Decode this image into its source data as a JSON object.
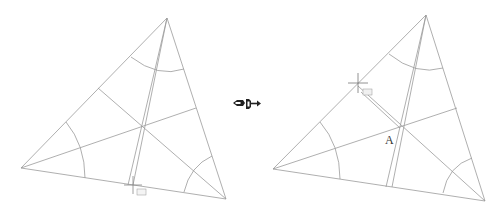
{
  "figure": {
    "caption_faint": "",
    "line_color": "#9a9a9a",
    "arc_color": "#8a8a8a",
    "panels": [
      {
        "id": "before",
        "vertices": {
          "top": [
            167,
            18
          ],
          "left": [
            21,
            168
          ],
          "right": [
            226,
            199
          ]
        },
        "center": [
          142,
          128
        ],
        "cursor": [
          133,
          185
        ],
        "cursor_tag": "≡≡"
      },
      {
        "id": "after",
        "vertices": {
          "top": [
            426,
            15
          ],
          "left": [
            273,
            169
          ],
          "right": [
            485,
            201
          ]
        },
        "center": [
          400,
          128
        ],
        "cursor": [
          358,
          83
        ],
        "cursor_tag": "≡≡",
        "point_label": "A"
      }
    ],
    "transition_icon": "arrow-right-icon"
  }
}
